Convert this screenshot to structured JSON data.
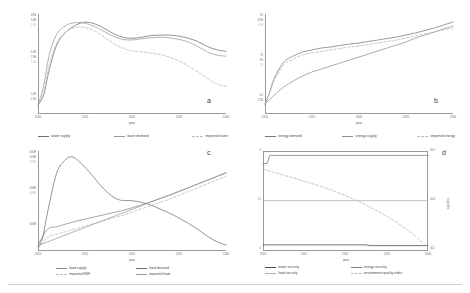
{
  "figure": {
    "panel_labels": {
      "a": "a",
      "b": "b",
      "c": "c",
      "d": "d"
    },
    "xlabel": "year"
  },
  "chart_data": [
    {
      "id": "a",
      "type": "line",
      "title": "",
      "panel_label": "a",
      "xlabel": "year",
      "ylabel": "",
      "xlim": [
        2010,
        2030
      ],
      "xticks": [
        "2010",
        "2015",
        "2020",
        "2025",
        "2030"
      ],
      "ylim": [
        2000000000.0,
        3700000000.0
      ],
      "yticks": [
        "3.6B",
        "3.0B",
        "2.4B",
        "1.8B",
        "1.2B",
        "2.4B",
        "2.3B",
        "1.1B",
        "2.2B",
        "2.1B"
      ],
      "ytick_labels": [
        "3.6B",
        "3.0B",
        "2.4B",
        "1.8B",
        "1.2B"
      ],
      "grid": false,
      "legend_position": "below",
      "series": [
        {
          "name": "water supply",
          "style": "solid",
          "color": "#6f6f6f",
          "x": [
            2010,
            2010.6,
            2011.2,
            2012,
            2013,
            2014,
            2015,
            2016,
            2017,
            2018,
            2019,
            2020,
            2021,
            2022,
            2023,
            2024,
            2025,
            2026,
            2027,
            2028,
            2029,
            2030
          ],
          "values": [
            2.06,
            2.25,
            2.72,
            3.18,
            3.42,
            3.54,
            3.6,
            3.57,
            3.49,
            3.39,
            3.32,
            3.3,
            3.32,
            3.35,
            3.36,
            3.36,
            3.34,
            3.3,
            3.24,
            3.15,
            3.09,
            3.06
          ]
        },
        {
          "name": "water demand",
          "style": "solid",
          "color": "#9a9a9a",
          "x": [
            2010,
            2010.6,
            2011.2,
            2012,
            2013,
            2014,
            2015,
            2016,
            2017,
            2018,
            2019,
            2020,
            2021,
            2022,
            2023,
            2024,
            2025,
            2026,
            2027,
            2028,
            2029,
            2030
          ],
          "values": [
            2.06,
            2.42,
            3.0,
            3.38,
            3.54,
            3.59,
            3.58,
            3.52,
            3.43,
            3.34,
            3.28,
            3.27,
            3.29,
            3.31,
            3.32,
            3.31,
            3.28,
            3.23,
            3.15,
            3.05,
            2.99,
            2.97
          ]
        },
        {
          "name": "imported water",
          "style": "dashed",
          "color": "#bdbdbd",
          "x": [
            2010,
            2010.6,
            2011.2,
            2012,
            2013,
            2014,
            2015,
            2016,
            2017,
            2018,
            2019,
            2020,
            2021,
            2022,
            2023,
            2024,
            2025,
            2026,
            2027,
            2028,
            2029,
            2030
          ],
          "values": [
            2.05,
            2.3,
            2.82,
            3.22,
            3.42,
            3.5,
            3.5,
            3.44,
            3.33,
            3.21,
            3.12,
            3.07,
            3.05,
            3.03,
            3.0,
            2.95,
            2.88,
            2.79,
            2.68,
            2.56,
            2.46,
            2.41
          ]
        }
      ]
    },
    {
      "id": "b",
      "type": "line",
      "title": "",
      "panel_label": "b",
      "xlabel": "year",
      "ylabel": "",
      "xlim": [
        2010,
        2030
      ],
      "xticks": [
        "2010",
        "2015",
        "2020",
        "2025",
        "2030"
      ],
      "ylim": [
        0,
        100
      ],
      "ytick_labels": [
        "90",
        "8.5B",
        "8.0B",
        "70",
        "60",
        "50",
        "5.0",
        "2.5B"
      ],
      "grid": false,
      "legend_position": "below",
      "series": [
        {
          "name": "energy demand",
          "style": "solid",
          "color": "#7a7a7a",
          "x": [
            2010,
            2010.5,
            2011,
            2012,
            2013,
            2014,
            2015,
            2016,
            2017,
            2018,
            2019,
            2020,
            2021,
            2022,
            2023,
            2024,
            2025,
            2026,
            2027,
            2028,
            2029,
            2030
          ],
          "values": [
            10,
            22,
            36,
            52,
            58,
            62,
            64,
            66,
            67,
            68.5,
            70,
            71,
            72.5,
            74,
            75.5,
            77,
            79,
            81,
            83.5,
            86,
            89,
            92
          ]
        },
        {
          "name": "energy supply",
          "style": "solid",
          "color": "#8f8f8f",
          "x": [
            2010,
            2011,
            2012,
            2013,
            2014,
            2015,
            2016,
            2017,
            2018,
            2019,
            2020,
            2021,
            2022,
            2023,
            2024,
            2025,
            2026,
            2027,
            2028,
            2029,
            2030
          ],
          "values": [
            10,
            19,
            27,
            33,
            38,
            42,
            45,
            48,
            51,
            54,
            57,
            60,
            63,
            66,
            69,
            72,
            76,
            79,
            82,
            85,
            88
          ]
        },
        {
          "name": "imported energy",
          "style": "dashed",
          "color": "#bdbdbd",
          "x": [
            2010,
            2010.5,
            2011,
            2012,
            2013,
            2014,
            2015,
            2016,
            2017,
            2018,
            2019,
            2020,
            2021,
            2022,
            2023,
            2024,
            2025,
            2026,
            2027,
            2028,
            2029,
            2030
          ],
          "values": [
            10,
            21,
            34,
            49,
            55,
            59,
            61,
            62.5,
            64,
            65.5,
            67,
            68,
            69.5,
            71,
            72.5,
            74,
            76,
            78,
            80,
            82,
            84,
            86
          ]
        }
      ]
    },
    {
      "id": "c",
      "type": "line",
      "title": "",
      "panel_label": "c",
      "xlabel": "year",
      "ylabel": "",
      "xlim": [
        2010,
        2030
      ],
      "xticks": [
        "2010",
        "2015",
        "2020",
        "2025",
        "2030"
      ],
      "ylim": [
        250000000,
        620000000
      ],
      "ytick_labels": [
        "600M",
        "500M",
        "515M",
        "400M",
        "640M",
        "300M"
      ],
      "grid": false,
      "legend_position": "below",
      "series": [
        {
          "name": "food supply",
          "style": "solid",
          "color": "#8a8a8a",
          "x": [
            2010,
            2011,
            2012,
            2013,
            2014,
            2015,
            2016,
            2017,
            2018,
            2019,
            2020,
            2021,
            2022,
            2023,
            2024,
            2025,
            2026,
            2027,
            2028,
            2029,
            2030
          ],
          "values": [
            272,
            330,
            340,
            350,
            360,
            368,
            376,
            384,
            392,
            400,
            410,
            420,
            432,
            444,
            456,
            470,
            484,
            498,
            512,
            526,
            540
          ]
        },
        {
          "name": "food demand",
          "style": "solid",
          "color": "#6f6f6f",
          "x": [
            2010,
            2010.5,
            2011,
            2012,
            2013,
            2013.5,
            2014,
            2015,
            2016,
            2017,
            2018,
            2018.6,
            2019,
            2020,
            2021,
            2022,
            2023,
            2024,
            2025,
            2026,
            2027,
            2028,
            2029,
            2030
          ],
          "values": [
            262,
            300,
            390,
            540,
            590,
            598,
            592,
            560,
            520,
            480,
            450,
            440,
            437,
            436,
            430,
            420,
            405,
            390,
            372,
            352,
            330,
            305,
            285,
            272
          ]
        },
        {
          "name": "imported NSF",
          "style": "dashed",
          "color": "#bdbdbd",
          "x": [
            2010,
            2011,
            2012,
            2013,
            2014,
            2015,
            2016,
            2017,
            2018,
            2019,
            2020,
            2021,
            2022,
            2023,
            2024,
            2025,
            2026,
            2027,
            2028,
            2029,
            2030
          ],
          "values": [
            258,
            300,
            312,
            322,
            332,
            342,
            352,
            362,
            372,
            382,
            394,
            406,
            418,
            430,
            442,
            456,
            470,
            484,
            498,
            512,
            526
          ]
        },
        {
          "name": "imported food",
          "style": "solid",
          "color": "#9a9a9a",
          "x": [
            2010,
            2030
          ],
          "values": [
            270,
            538
          ]
        }
      ]
    },
    {
      "id": "d",
      "type": "line",
      "title": "",
      "panel_label": "d",
      "xlabel": "year",
      "ylabel": "eqindex",
      "xlim": [
        2010,
        2030
      ],
      "xticks": [
        "2010",
        "2015",
        "2020",
        "2025",
        "2030"
      ],
      "ylim": [
        0,
        5
      ],
      "ytick_labels": [
        "5",
        "2.5",
        "0"
      ],
      "y2lim": [
        40.1,
        40.55
      ],
      "y2tick_labels": [
        "40.5",
        "40.4",
        "40.2"
      ],
      "grid": false,
      "legend_position": "below",
      "series": [
        {
          "name": "water security",
          "style": "solid",
          "color": "#4a4a4a",
          "x": [
            2010,
            2022.5,
            2023,
            2030
          ],
          "values": [
            0.32,
            0.32,
            0.28,
            0.28
          ]
        },
        {
          "name": "energy security",
          "style": "solid",
          "color": "#7a7a7a",
          "x": [
            2010,
            2010.5,
            2010.8,
            2011,
            2030
          ],
          "values": [
            4.55,
            4.55,
            4.95,
            4.97,
            4.97
          ]
        },
        {
          "name": "food security",
          "style": "solid",
          "color": "#b0b0b0",
          "x": [
            2010,
            2030
          ],
          "values": [
            2.62,
            2.62
          ]
        },
        {
          "name": "environment quality index",
          "style": "dashed",
          "color": "#bdbdbd",
          "x": [
            2010,
            2012,
            2014,
            2016,
            2018,
            2020,
            2022,
            2024,
            2026,
            2028,
            2029.3,
            2030
          ],
          "values": [
            4.25,
            4.0,
            3.76,
            3.5,
            3.22,
            2.88,
            2.5,
            2.05,
            1.55,
            0.95,
            0.45,
            0.2
          ]
        }
      ]
    }
  ],
  "panels": {
    "a": {
      "label": "a",
      "xlabel": "year",
      "xticks": [
        "2010",
        "2015",
        "2020",
        "2025",
        "2030"
      ],
      "yticks": [
        "3.6B",
        "3.0B",
        "2.4B",
        "2.4B",
        "2.3B",
        "1.1B",
        "2.2B",
        "2.1B"
      ],
      "legend": [
        {
          "label": "water supply",
          "style": "solid",
          "color": "#6f6f6f"
        },
        {
          "label": "water demand",
          "style": "solid",
          "color": "#9a9a9a"
        },
        {
          "label": "imported water",
          "style": "dashed",
          "color": "#bdbdbd"
        }
      ]
    },
    "b": {
      "label": "b",
      "xlabel": "year",
      "xticks": [
        "2010",
        "2015",
        "2020",
        "2025",
        "2030"
      ],
      "yticks": [
        "90",
        "8.5B",
        "8.0B",
        "70",
        "60",
        "50",
        "5.0",
        "2.5B"
      ],
      "legend": [
        {
          "label": "energy demand",
          "style": "solid",
          "color": "#7a7a7a"
        },
        {
          "label": "energy supply",
          "style": "solid",
          "color": "#8f8f8f"
        },
        {
          "label": "imported energy",
          "style": "dashed",
          "color": "#bdbdbd"
        }
      ]
    },
    "c": {
      "label": "c",
      "xlabel": "year",
      "xticks": [
        "2010",
        "2015",
        "2020",
        "2025",
        "2030"
      ],
      "yticks": [
        "600M",
        "500M",
        "515M",
        "400M",
        "640M",
        "300M"
      ],
      "legend": [
        {
          "label": "food supply",
          "style": "solid",
          "color": "#8a8a8a"
        },
        {
          "label": "food demand",
          "style": "solid",
          "color": "#6f6f6f"
        },
        {
          "label": "imported NSF",
          "style": "dashed",
          "color": "#bdbdbd"
        },
        {
          "label": "imported food",
          "style": "solid",
          "color": "#9a9a9a"
        }
      ]
    },
    "d": {
      "label": "d",
      "xlabel": "year",
      "ylabel2": "eqindex",
      "xticks": [
        "2010",
        "2015",
        "2020",
        "2025",
        "2030"
      ],
      "yticks": [
        "5",
        "2.5",
        "0"
      ],
      "yticks2": [
        "40.5",
        "40.4",
        "40.2"
      ],
      "legend": [
        {
          "label": "water security",
          "style": "solid",
          "color": "#4a4a4a"
        },
        {
          "label": "energy security",
          "style": "solid",
          "color": "#7a7a7a"
        },
        {
          "label": "food security",
          "style": "solid",
          "color": "#b0b0b0"
        },
        {
          "label": "environment quality index",
          "style": "dashed",
          "color": "#bdbdbd"
        }
      ]
    }
  }
}
